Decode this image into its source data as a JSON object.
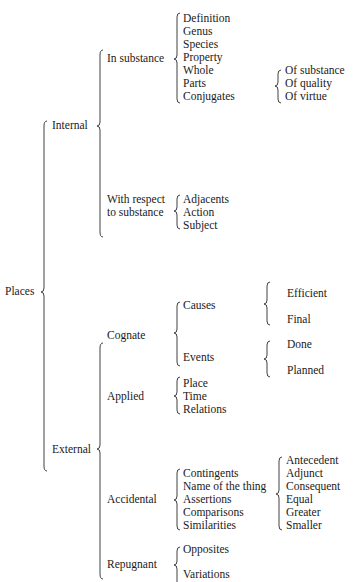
{
  "root": {
    "label": "Places",
    "children": [
      {
        "label": "Internal",
        "children": [
          {
            "label": "In substance",
            "items": [
              "Definition",
              "Genus",
              "Species",
              "Property",
              "Whole",
              "Parts",
              "Conjugates"
            ],
            "sub": {
              "attached_to": [
                "Whole",
                "Parts",
                "Conjugates"
              ],
              "items": [
                "Of substance",
                "Of quality",
                "Of virtue"
              ]
            }
          },
          {
            "label_lines": [
              "With respect",
              "to substance"
            ],
            "items": [
              "Adjacents",
              "Action",
              "Subject"
            ]
          }
        ]
      },
      {
        "label": "External",
        "children": [
          {
            "label": "Cognate",
            "items": [
              {
                "label": "Causes",
                "items": [
                  "Efficient",
                  "Final"
                ]
              },
              {
                "label": "Events",
                "items": [
                  "Done",
                  "Planned"
                ]
              }
            ]
          },
          {
            "label": "Applied",
            "items": [
              "Place",
              "Time",
              "Relations"
            ]
          },
          {
            "label": "Accidental",
            "items": [
              "Contingents",
              "Name of the thing",
              "Assertions",
              "Comparisons",
              "Similarities"
            ],
            "sub": {
              "items": [
                "Antecedent",
                "Adjunct",
                "Consequent",
                "Equal",
                "Greater",
                "Smaller"
              ]
            }
          },
          {
            "label": "Repugnant",
            "items": [
              "Opposites",
              "Variations"
            ]
          }
        ]
      }
    ]
  }
}
